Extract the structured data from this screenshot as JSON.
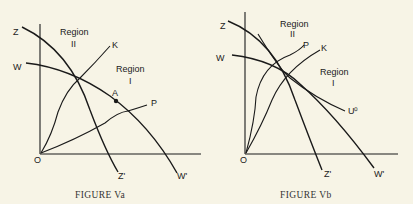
{
  "figures": [
    {
      "caption": "FIGURE Va",
      "labels": {
        "z": "Z",
        "z_prime": "Z'",
        "w": "W",
        "w_prime": "W'",
        "k": "K",
        "p": "P",
        "a": "A",
        "o": "O",
        "region2_word": "Region",
        "region2_num": "II",
        "region1_word": "Region",
        "region1_num": "I"
      }
    },
    {
      "caption": "FIGURE Vb",
      "labels": {
        "z": "Z",
        "z_prime": "Z'",
        "w": "W",
        "w_prime": "W'",
        "k": "K",
        "p": "P",
        "u0": "U⁰",
        "o": "O",
        "region2_word": "Region",
        "region2_num": "II",
        "region1_word": "Region",
        "region1_num": "I"
      }
    }
  ]
}
